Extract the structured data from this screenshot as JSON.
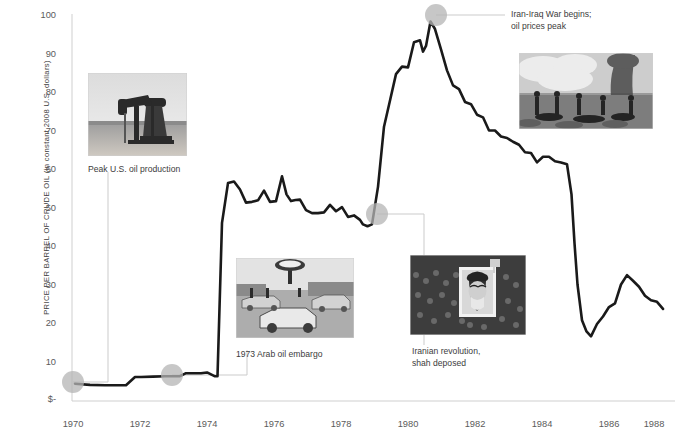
{
  "chart_data": {
    "type": "line",
    "title": "",
    "xlabel": "",
    "ylabel": "PRICE PER BARREL OF CRUDE OIL (in constant 2008 U.S. dollars)",
    "xlim": [
      1969.3,
      1989.3
    ],
    "ylim": [
      0,
      103
    ],
    "grid": false,
    "legend": null,
    "y_ticks": [
      "$-",
      "10",
      "20",
      "30",
      "40",
      "50",
      "60",
      "70",
      "80",
      "90",
      "100"
    ],
    "y_tick_values": [
      0,
      10,
      20,
      30,
      40,
      50,
      60,
      70,
      80,
      90,
      100
    ],
    "x_ticks": [
      "1970",
      "1972",
      "1974",
      "1976",
      "1978",
      "1980",
      "1982",
      "1984",
      "1986",
      "1988"
    ],
    "x_tick_values": [
      1970,
      1972,
      1974,
      1976,
      1978,
      1980,
      1982,
      1984,
      1986,
      1988
    ],
    "series": [
      {
        "name": "Crude oil price (constant 2008 USD)",
        "color": "#1a1a1a",
        "x": [
          1969.4,
          1969.9,
          1970.4,
          1970.9,
          1971.1,
          1971.4,
          1971.6,
          1972.0,
          1972.4,
          1972.9,
          1973.1,
          1973.4,
          1973.6,
          1973.8,
          1973.95,
          1974.05,
          1974.15,
          1974.3,
          1974.5,
          1974.7,
          1974.9,
          1975.1,
          1975.3,
          1975.5,
          1975.7,
          1975.9,
          1976.1,
          1976.3,
          1976.45,
          1976.6,
          1976.75,
          1976.9,
          1977.1,
          1977.3,
          1977.5,
          1977.7,
          1977.9,
          1978.1,
          1978.3,
          1978.5,
          1978.7,
          1978.9,
          1979.0,
          1979.15,
          1979.3,
          1979.5,
          1979.7,
          1979.9,
          1980.1,
          1980.3,
          1980.5,
          1980.7,
          1980.9,
          1981.0,
          1981.1,
          1981.25,
          1981.4,
          1981.6,
          1981.8,
          1982.0,
          1982.2,
          1982.4,
          1982.6,
          1982.8,
          1983.0,
          1983.2,
          1983.4,
          1983.6,
          1983.8,
          1984.0,
          1984.2,
          1984.4,
          1984.6,
          1984.8,
          1985.0,
          1985.2,
          1985.4,
          1985.6,
          1985.8,
          1985.95,
          1986.05,
          1986.15,
          1986.3,
          1986.45,
          1986.6,
          1986.8,
          1987.0,
          1987.2,
          1987.4,
          1987.6,
          1987.8,
          1988.0,
          1988.2,
          1988.4,
          1988.6,
          1988.8,
          1989.0
        ],
        "y": [
          4.6,
          4.3,
          4.2,
          4.2,
          4.2,
          6.4,
          6.4,
          6.5,
          6.6,
          6.6,
          7.4,
          7.4,
          7.4,
          7.6,
          7.0,
          6.6,
          6.6,
          47.4,
          58.0,
          58.4,
          56.3,
          52.8,
          53.0,
          53.4,
          56.0,
          53.0,
          53.2,
          59.8,
          55.0,
          53.2,
          53.5,
          53.6,
          50.8,
          50.0,
          50.0,
          50.2,
          52.2,
          50.5,
          51.6,
          49.0,
          49.4,
          48.2,
          47.0,
          46.5,
          47.0,
          57.0,
          73.0,
          80.0,
          87.0,
          89.0,
          88.8,
          95.5,
          96.0,
          93.0,
          94.5,
          101.0,
          99.0,
          93.6,
          88.0,
          84.0,
          83.0,
          79.6,
          79.0,
          76.2,
          75.5,
          72.0,
          72.0,
          70.4,
          70.0,
          69.0,
          68.2,
          66.2,
          66.0,
          63.5,
          65.0,
          65.0,
          63.8,
          63.5,
          63.0,
          55.0,
          42.0,
          31.0,
          21.5,
          18.5,
          17.2,
          20.5,
          22.5,
          25.0,
          26.0,
          31.0,
          33.5,
          32.0,
          30.4,
          28.0,
          26.8,
          26.4,
          24.5
        ]
      }
    ],
    "markers": [
      {
        "id": "peak-us-oil-production",
        "x": 1969.4,
        "y": 4.6,
        "label": "Peak U.S. oil production"
      },
      {
        "id": "arab-oil-embargo",
        "x": 1972.9,
        "y": 6.6,
        "label": "1973 Arab oil embargo"
      },
      {
        "id": "iranian-revolution",
        "x": 1979.05,
        "y": 46.6,
        "label": "Iranian revolution,\nshah deposed"
      },
      {
        "id": "iran-iraq-war",
        "x": 1981.25,
        "y": 101.0,
        "label": "Iran-Iraq War begins;\noil prices peak"
      }
    ],
    "annotations": [
      {
        "id": "peak-us-oil-production",
        "text": "Peak U.S. oil production"
      },
      {
        "id": "arab-oil-embargo",
        "text": "1973 Arab oil embargo"
      },
      {
        "id": "iranian-revolution",
        "text": "Iranian revolution,\nshah deposed"
      },
      {
        "id": "iran-iraq-war",
        "text": "Iran-Iraq War begins;\noil prices peak"
      }
    ],
    "photos": [
      {
        "id": "oil-pumpjack-photo",
        "caption": "Peak U.S. oil production"
      },
      {
        "id": "gas-station-queue-photo",
        "caption": "1973 Arab oil embargo"
      },
      {
        "id": "iranian-crowd-khomeini-photo",
        "caption": "Iranian revolution, shah deposed"
      },
      {
        "id": "war-smoke-photo",
        "caption": "Iran-Iraq War begins; oil prices peak"
      }
    ],
    "colors": {
      "line": "#1a1a1a",
      "marker": "#b4b4b4",
      "axis": "#cfcfcf",
      "leader": "#cccccc",
      "text": "#4a4a4a",
      "background": "#ffffff"
    }
  }
}
